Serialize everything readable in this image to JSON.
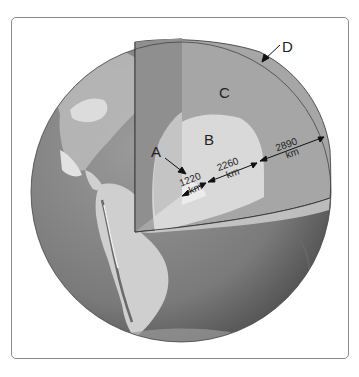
{
  "diagram": {
    "type": "earth-interior-cutaway",
    "labels": {
      "a": "A",
      "b": "B",
      "c": "C",
      "d": "D"
    },
    "measurements": {
      "inner": {
        "value": "1220",
        "unit": "km"
      },
      "middle": {
        "value": "2260",
        "unit": "km"
      },
      "outer": {
        "value": "2890",
        "unit": "km"
      }
    },
    "colors": {
      "frame_border": "#8a8a8a",
      "globe_ocean": "#7d7d7d",
      "land": "#c8c8c8",
      "layer_c_face": "#a6a6a6",
      "layer_c_side": "#8f8f8f",
      "layer_b_face": "#d9d9d9",
      "layer_b_side": "#c4c4c4",
      "layer_a": "#ededed",
      "text": "#222222"
    }
  }
}
